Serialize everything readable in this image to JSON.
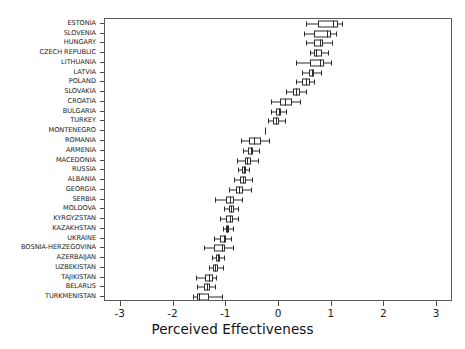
{
  "chart_data": {
    "type": "box",
    "title": "",
    "xlabel": "Perceived Effectiveness",
    "ylabel": "",
    "xlim": [
      -3.3,
      3.3
    ],
    "xticks": [
      -3,
      -2,
      -1,
      0,
      1,
      2,
      3
    ],
    "xticklabels": [
      "-3",
      "-2",
      "-1",
      "0",
      "1",
      "2",
      "3"
    ],
    "grid": false,
    "legend": null,
    "orientation": "horizontal",
    "categories": [
      "ESTONIA",
      "SLOVENIA",
      "HUNGARY",
      "CZECH REPUBLIC",
      "LITHUANIA",
      "LATVIA",
      "POLAND",
      "SLOVAKIA",
      "CROATIA",
      "BULGARIA",
      "TURKEY",
      "MONTENEGRO",
      "ROMANIA",
      "ARMENIA",
      "MACEDONIA",
      "RUSSIA",
      "ALBANIA",
      "GEORGIA",
      "SERBIA",
      "MOLDOVA",
      "KYRGYZSTAN",
      "KAZAKHSTAN",
      "UKRAINE",
      "BOSNIA-HERZEGOVINA",
      "AZERBAIJAN",
      "UZBEKISTAN",
      "TAJIKISTAN",
      "BELARUS",
      "TURKMENISTAN"
    ],
    "boxes": [
      {
        "label": "ESTONIA",
        "whisker_low": 0.51,
        "q1": 0.74,
        "median": 1.02,
        "q3": 1.11,
        "whisker_high": 1.19
      },
      {
        "label": "SLOVENIA",
        "whisker_low": 0.47,
        "q1": 0.67,
        "median": 0.91,
        "q3": 0.98,
        "whisker_high": 1.09
      },
      {
        "label": "HUNGARY",
        "whisker_low": 0.51,
        "q1": 0.67,
        "median": 0.77,
        "q3": 0.84,
        "whisker_high": 1.0
      },
      {
        "label": "CZECH REPUBLIC",
        "whisker_low": 0.58,
        "q1": 0.67,
        "median": 0.7,
        "q3": 0.81,
        "whisker_high": 0.93
      },
      {
        "label": "LITHUANIA",
        "whisker_low": 0.33,
        "q1": 0.58,
        "median": 0.77,
        "q3": 0.86,
        "whisker_high": 0.98
      },
      {
        "label": "LATVIA",
        "whisker_low": 0.44,
        "q1": 0.56,
        "median": 0.63,
        "q3": 0.67,
        "whisker_high": 0.79
      },
      {
        "label": "POLAND",
        "whisker_low": 0.32,
        "q1": 0.44,
        "median": 0.51,
        "q3": 0.58,
        "whisker_high": 0.67
      },
      {
        "label": "SLOVAKIA",
        "whisker_low": 0.14,
        "q1": 0.26,
        "median": 0.33,
        "q3": 0.4,
        "whisker_high": 0.51
      },
      {
        "label": "CROATIA",
        "whisker_low": -0.16,
        "q1": 0.02,
        "median": 0.11,
        "q3": 0.25,
        "whisker_high": 0.4
      },
      {
        "label": "BULGARIA",
        "whisker_low": -0.16,
        "q1": -0.05,
        "median": 0.0,
        "q3": 0.04,
        "whisker_high": 0.14
      },
      {
        "label": "TURKEY",
        "whisker_low": -0.21,
        "q1": -0.12,
        "median": -0.05,
        "q3": 0.0,
        "whisker_high": 0.11
      },
      {
        "label": "MONTENEGRO",
        "whisker_low": -0.26,
        "q1": -0.26,
        "median": -0.26,
        "q3": -0.26,
        "whisker_high": -0.26
      },
      {
        "label": "ROMANIA",
        "whisker_low": -0.72,
        "q1": -0.56,
        "median": -0.47,
        "q3": -0.35,
        "whisker_high": -0.19
      },
      {
        "label": "ARMENIA",
        "whisker_low": -0.68,
        "q1": -0.58,
        "median": -0.53,
        "q3": -0.49,
        "whisker_high": -0.37
      },
      {
        "label": "MACEDONIA",
        "whisker_low": -0.79,
        "q1": -0.65,
        "median": -0.6,
        "q3": -0.53,
        "whisker_high": -0.4
      },
      {
        "label": "RUSSIA",
        "whisker_low": -0.77,
        "q1": -0.7,
        "median": -0.67,
        "q3": -0.63,
        "whisker_high": -0.56
      },
      {
        "label": "ALBANIA",
        "whisker_low": -0.86,
        "q1": -0.74,
        "median": -0.68,
        "q3": -0.63,
        "whisker_high": -0.51
      },
      {
        "label": "GEORGIA",
        "whisker_low": -0.95,
        "q1": -0.81,
        "median": -0.75,
        "q3": -0.68,
        "whisker_high": -0.53
      },
      {
        "label": "SERBIA",
        "whisker_low": -1.21,
        "q1": -1.0,
        "median": -0.93,
        "q3": -0.86,
        "whisker_high": -0.7
      },
      {
        "label": "MOLDOVA",
        "whisker_low": -1.05,
        "q1": -0.95,
        "median": -0.91,
        "q3": -0.86,
        "whisker_high": -0.77
      },
      {
        "label": "KYRGYZSTAN",
        "whisker_low": -1.12,
        "q1": -1.0,
        "median": -0.93,
        "q3": -0.88,
        "whisker_high": -0.77
      },
      {
        "label": "KAZAKHSTAN",
        "whisker_low": -1.07,
        "q1": -1.0,
        "median": -0.98,
        "q3": -0.95,
        "whisker_high": -0.88
      },
      {
        "label": "UKRAINE",
        "whisker_low": -1.23,
        "q1": -1.12,
        "median": -1.05,
        "q3": -1.0,
        "whisker_high": -0.91
      },
      {
        "label": "BOSNIA-HERZEGOVINA",
        "whisker_low": -1.42,
        "q1": -1.23,
        "median": -1.09,
        "q3": -1.02,
        "whisker_high": -0.88
      },
      {
        "label": "AZERBAIJAN",
        "whisker_low": -1.28,
        "q1": -1.19,
        "median": -1.16,
        "q3": -1.12,
        "whisker_high": -1.04
      },
      {
        "label": "UZBEKISTAN",
        "whisker_low": -1.33,
        "q1": -1.25,
        "median": -1.21,
        "q3": -1.16,
        "whisker_high": -1.07
      },
      {
        "label": "TAJIKISTAN",
        "whisker_low": -1.58,
        "q1": -1.4,
        "median": -1.33,
        "q3": -1.26,
        "whisker_high": -1.19
      },
      {
        "label": "BELARUS",
        "whisker_low": -1.56,
        "q1": -1.42,
        "median": -1.37,
        "q3": -1.3,
        "whisker_high": -1.21
      },
      {
        "label": "TURKMENISTAN",
        "whisker_low": -1.63,
        "q1": -1.56,
        "median": -1.51,
        "q3": -1.32,
        "whisker_high": -1.09
      }
    ],
    "colors": {
      "box_edge": "#2b2b2b",
      "box_fill": "#ffffff",
      "median": "#2b2b2b",
      "whisker": "#2b2b2b",
      "frame": "#5a5a5a",
      "text": "#1c1c1c",
      "background": "#ffffff"
    }
  }
}
